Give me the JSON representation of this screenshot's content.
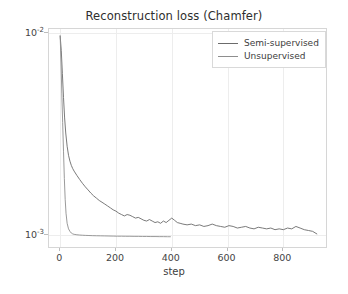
{
  "chart_data": {
    "type": "line",
    "title": "Reconstruction loss (Chamfer)",
    "xlabel": "step",
    "ylabel": "",
    "yscale": "log",
    "xscale": "linear",
    "xlim": [
      -40,
      960
    ],
    "ylim": [
      0.00085,
      0.0105
    ],
    "grid": true,
    "legend_position": "upper right",
    "xticks": [
      0,
      200,
      400,
      600,
      800
    ],
    "xtick_labels": [
      "0",
      "200",
      "400",
      "600",
      "800"
    ],
    "yticks": [
      0.01,
      0.001
    ],
    "ytick_labels": [
      "10⁻²",
      "10⁻³"
    ],
    "ytick_mantissa": [
      "10",
      "10"
    ],
    "ytick_exponent": [
      "-2",
      "-3"
    ],
    "series": [
      {
        "name": "Semi-supervised",
        "color": "#6b6b6b",
        "x": [
          0,
          4,
          8,
          12,
          16,
          20,
          25,
          30,
          35,
          40,
          45,
          50,
          60,
          70,
          80,
          90,
          100,
          110,
          120,
          130,
          140,
          150,
          160,
          170,
          180,
          190,
          200,
          210,
          220,
          230,
          240,
          250,
          260,
          270,
          280,
          290,
          300,
          310,
          320,
          330,
          340,
          350,
          360,
          370,
          380,
          390,
          400,
          410,
          420,
          430,
          440,
          455,
          470,
          485,
          500,
          515,
          530,
          545,
          560,
          575,
          590,
          605,
          620,
          635,
          650,
          665,
          680,
          695,
          710,
          725,
          740,
          755,
          770,
          785,
          800,
          815,
          830,
          845,
          860,
          875,
          890,
          905,
          920
        ],
        "y": [
          0.0097,
          0.0082,
          0.0063,
          0.0048,
          0.0038,
          0.0032,
          0.00275,
          0.00248,
          0.00232,
          0.00221,
          0.00213,
          0.00207,
          0.00197,
          0.00188,
          0.0018,
          0.00173,
          0.00167,
          0.00161,
          0.00156,
          0.00152,
          0.00148,
          0.00145,
          0.00142,
          0.00139,
          0.00136,
          0.00133,
          0.00131,
          0.00128,
          0.00126,
          0.00124,
          0.00126,
          0.00125,
          0.00123,
          0.00121,
          0.00122,
          0.0012,
          0.00118,
          0.00117,
          0.00119,
          0.00117,
          0.00115,
          0.00116,
          0.00114,
          0.00117,
          0.00115,
          0.00118,
          0.00121,
          0.00118,
          0.00115,
          0.00114,
          0.00113,
          0.00112,
          0.00113,
          0.00111,
          0.00112,
          0.0011,
          0.00111,
          0.00113,
          0.00111,
          0.0011,
          0.00109,
          0.00111,
          0.0011,
          0.00108,
          0.00109,
          0.0011,
          0.00108,
          0.00107,
          0.00109,
          0.00108,
          0.00107,
          0.00108,
          0.00106,
          0.00107,
          0.00106,
          0.00108,
          0.00107,
          0.0011,
          0.00108,
          0.00106,
          0.00105,
          0.00104,
          0.00101
        ]
      },
      {
        "name": "Unsupervised",
        "color": "#8e8e8e",
        "x": [
          0,
          3,
          6,
          9,
          12,
          15,
          18,
          21,
          25,
          30,
          35,
          40,
          45,
          50,
          60,
          70,
          80,
          90,
          100,
          115,
          130,
          145,
          160,
          175,
          190,
          205,
          220,
          235,
          250,
          265,
          280,
          295,
          310,
          325,
          340,
          355,
          370,
          385,
          395
        ],
        "y": [
          0.0097,
          0.0072,
          0.005,
          0.0036,
          0.0026,
          0.0019,
          0.0015,
          0.00128,
          0.00114,
          0.00107,
          0.00104,
          0.00102,
          0.00101,
          0.001005,
          0.001,
          0.000997,
          0.000995,
          0.000993,
          0.000992,
          0.00099,
          0.000989,
          0.000988,
          0.000987,
          0.000986,
          0.000985,
          0.000984,
          0.000984,
          0.000983,
          0.000983,
          0.000982,
          0.000982,
          0.000981,
          0.000981,
          0.00098,
          0.00098,
          0.000979,
          0.000979,
          0.000978,
          0.000978
        ]
      }
    ],
    "legend": [
      {
        "label": "Semi-supervised",
        "color": "#6b6b6b"
      },
      {
        "label": "Unsupervised",
        "color": "#8e8e8e"
      }
    ]
  }
}
